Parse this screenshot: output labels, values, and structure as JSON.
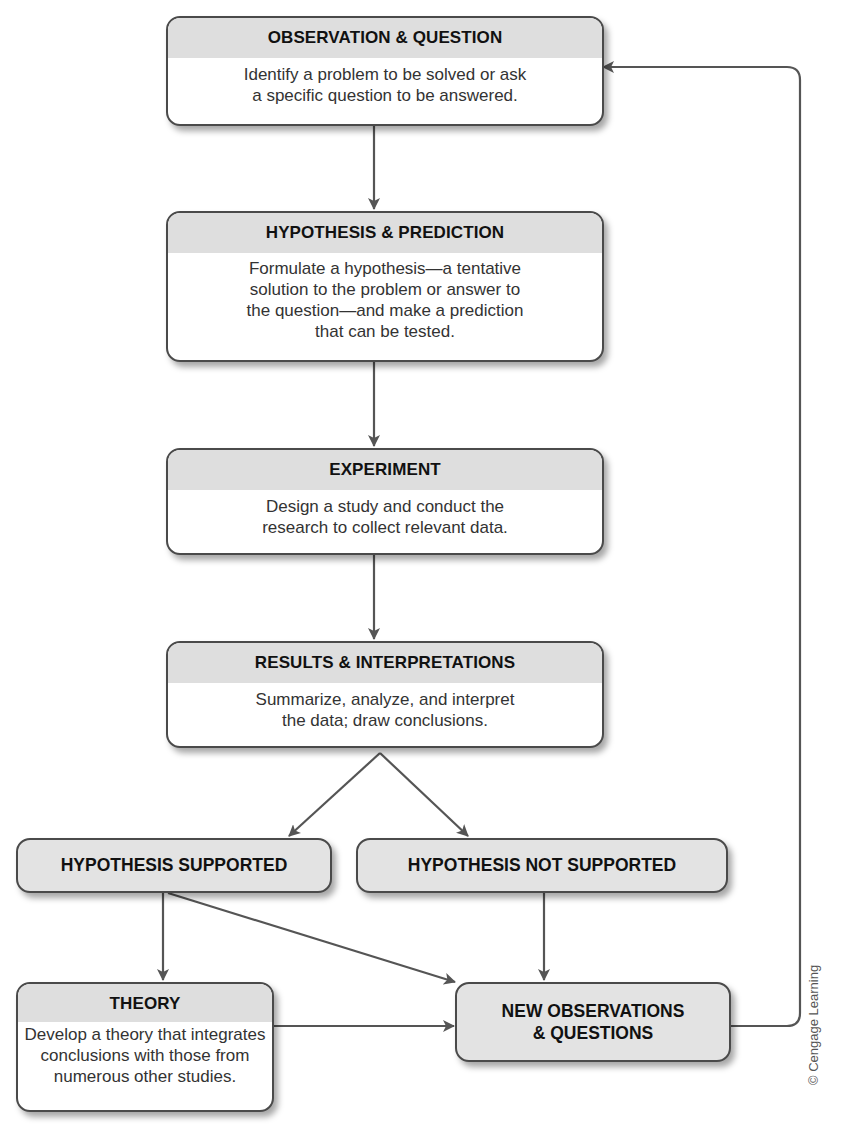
{
  "diagram": {
    "nodes": {
      "observation": {
        "heading": "OBSERVATION & QUESTION",
        "lines": [
          "Identify a problem to be solved or ask",
          "a specific question to be answered."
        ]
      },
      "hypothesis": {
        "heading": "HYPOTHESIS & PREDICTION",
        "lines": [
          "Formulate a hypothesis—a tentative",
          "solution to the problem or answer to",
          "the question—and make a prediction",
          "that can be tested."
        ]
      },
      "experiment": {
        "heading": "EXPERIMENT",
        "lines": [
          "Design a study and conduct the",
          "research to collect relevant data."
        ]
      },
      "results": {
        "heading": "RESULTS & INTERPRETATIONS",
        "lines": [
          "Summarize, analyze, and interpret",
          "the data; draw conclusions."
        ]
      },
      "supported": {
        "heading": "HYPOTHESIS SUPPORTED"
      },
      "not_supported": {
        "heading": "HYPOTHESIS NOT SUPPORTED"
      },
      "theory": {
        "heading": "THEORY",
        "lines": [
          "Develop a theory that integrates",
          "conclusions with those from",
          "numerous other studies."
        ]
      },
      "new_observations": {
        "lines": [
          "NEW OBSERVATIONS",
          "& QUESTIONS"
        ]
      }
    },
    "edges": [
      {
        "from": "observation",
        "to": "hypothesis"
      },
      {
        "from": "hypothesis",
        "to": "experiment"
      },
      {
        "from": "experiment",
        "to": "results"
      },
      {
        "from": "results",
        "to": "supported"
      },
      {
        "from": "results",
        "to": "not_supported"
      },
      {
        "from": "supported",
        "to": "theory"
      },
      {
        "from": "supported",
        "to": "new_observations"
      },
      {
        "from": "not_supported",
        "to": "new_observations"
      },
      {
        "from": "theory",
        "to": "new_observations"
      },
      {
        "from": "new_observations",
        "to": "observation"
      }
    ],
    "colors": {
      "line": "#555555",
      "header": "#dedede",
      "border": "#4a4a4a"
    },
    "credit": "© Cengage Learning"
  }
}
